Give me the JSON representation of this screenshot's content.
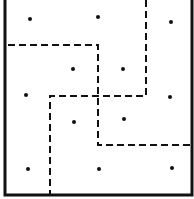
{
  "diagram": {
    "width": 194,
    "height": 199,
    "colors": {
      "ink": "#111111",
      "background": "#ffffff"
    },
    "frame": {
      "left_x": 5,
      "right_x": 192,
      "bottom_y": 195,
      "top_open": true
    },
    "dots": [
      {
        "x": 30,
        "y": 19
      },
      {
        "x": 98,
        "y": 17
      },
      {
        "x": 171,
        "y": 22
      },
      {
        "x": 73,
        "y": 69
      },
      {
        "x": 123,
        "y": 69
      },
      {
        "x": 26,
        "y": 95
      },
      {
        "x": 170,
        "y": 97
      },
      {
        "x": 74,
        "y": 122
      },
      {
        "x": 124,
        "y": 119
      },
      {
        "x": 28,
        "y": 169
      },
      {
        "x": 99,
        "y": 169
      },
      {
        "x": 172,
        "y": 168
      }
    ],
    "dashed_paths": [
      {
        "name": "path-a",
        "points": "8,45 98,45 98,145 190,145"
      },
      {
        "name": "path-b",
        "points": "146,0 146,96 50,96 50,194"
      }
    ]
  }
}
